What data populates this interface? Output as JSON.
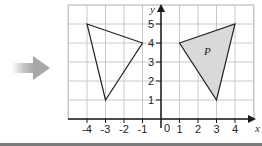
{
  "arrow": {
    "icon": "arrow-right-icon",
    "color": "#b5b5b5"
  },
  "graph": {
    "x_axis_label": "x",
    "y_axis_label": "y",
    "origin_label": "0",
    "x_ticks": [
      "-4",
      "-3",
      "-2",
      "-1",
      "1",
      "2",
      "3",
      "4"
    ],
    "y_ticks": [
      "1",
      "2",
      "3",
      "4",
      "5"
    ],
    "grid_color": "#c8c8c8",
    "axis_color": "#1a1a1a"
  },
  "shapes": {
    "image_triangle": {
      "vertices": [
        [
          -4,
          5
        ],
        [
          -1,
          4
        ],
        [
          -3,
          1
        ]
      ],
      "fill": "none"
    },
    "triangle_p": {
      "label": "P",
      "vertices": [
        [
          1,
          4
        ],
        [
          4,
          5
        ],
        [
          3,
          1
        ]
      ],
      "fill": "#d9d9d9"
    }
  },
  "chart_data": {
    "type": "diagram",
    "title": "",
    "xlabel": "x",
    "ylabel": "y",
    "xlim": [
      -4,
      4
    ],
    "ylim": [
      0,
      5
    ],
    "grid": true,
    "shapes": [
      {
        "name": "P",
        "vertices": [
          [
            1,
            4
          ],
          [
            4,
            5
          ],
          [
            3,
            1
          ]
        ],
        "shaded": true
      },
      {
        "name": "reflection",
        "vertices": [
          [
            -4,
            5
          ],
          [
            -1,
            4
          ],
          [
            -3,
            1
          ]
        ],
        "shaded": false
      }
    ]
  }
}
